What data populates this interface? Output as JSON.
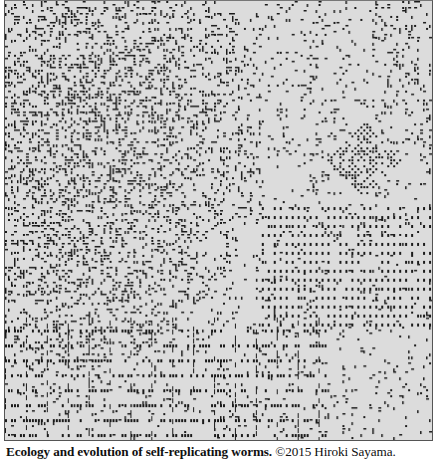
{
  "figure": {
    "colors": {
      "background": "#dcdcdc",
      "worm": "#1a1a1a",
      "border": "#555555"
    }
  },
  "caption": {
    "title": "Ecology and evolution of self-replicating worms.",
    "copyright_symbol": "©",
    "credit": "2015 Hiroki Sayama."
  }
}
